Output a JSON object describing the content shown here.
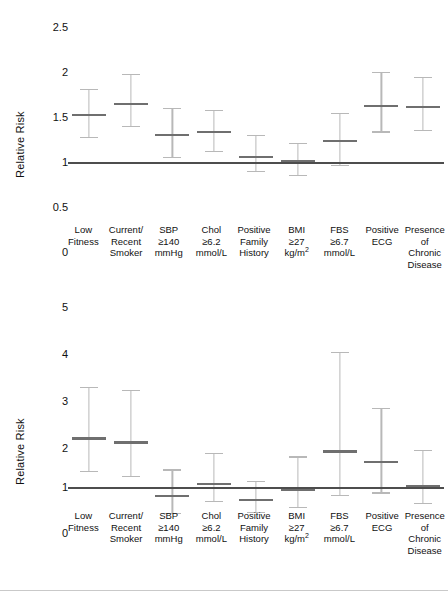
{
  "figure": {
    "background": "#ffffff",
    "line_color": "#b8b8b8",
    "marker_color": "#6f6f6f",
    "reference_line_color": "#4d4d4d"
  },
  "categories": [
    {
      "id": "low-fitness",
      "line1": "Low",
      "line2": "Fitness",
      "line3": "",
      "sup": ""
    },
    {
      "id": "current-smoker",
      "line1": "Current/",
      "line2": "Recent",
      "line3": "Smoker",
      "sup": ""
    },
    {
      "id": "sbp",
      "line1": "SBP",
      "line2": "≥140",
      "line3": "mmHg",
      "sup": ""
    },
    {
      "id": "chol",
      "line1": "Chol",
      "line2": "≥6.2",
      "line3": "mmol/L",
      "sup": ""
    },
    {
      "id": "family-history",
      "line1": "Positive",
      "line2": "Family",
      "line3": "History",
      "sup": ""
    },
    {
      "id": "bmi",
      "line1": "BMI",
      "line2": "≥27",
      "line3": "kg/m",
      "sup": "2"
    },
    {
      "id": "fbs",
      "line1": "FBS",
      "line2": "≥6.7",
      "line3": "mmol/L",
      "sup": ""
    },
    {
      "id": "positive-ecg",
      "line1": "Positive",
      "line2": "ECG",
      "line3": "",
      "sup": ""
    },
    {
      "id": "chronic-disease",
      "line1": "Presence",
      "line2": "of Chronic",
      "line3": "Disease",
      "sup": ""
    }
  ],
  "chart_data": [
    {
      "id": "chart-top",
      "type": "scatter",
      "title": "",
      "xlabel": "",
      "ylabel": "Relative Risk",
      "ylim": [
        0,
        2.5
      ],
      "yticks": [
        "0",
        "0.5",
        "1",
        "1.5",
        "2",
        "2.5"
      ],
      "ytick_values": [
        0,
        0.5,
        1,
        1.5,
        2,
        2.5
      ],
      "grid": false,
      "legend": "none",
      "reference_line": 1,
      "categories": [
        "Low Fitness",
        "Current/ Recent Smoker",
        "SBP ≥140 mmHg",
        "Chol ≥6.2 mmol/L",
        "Positive Family History",
        "BMI ≥27 kg/m2",
        "FBS ≥6.7 mmol/L",
        "Positive ECG",
        "Presence of Chronic Disease"
      ],
      "values": [
        1.52,
        1.65,
        1.3,
        1.33,
        1.06,
        1.01,
        1.23,
        1.62,
        1.61
      ],
      "lower": [
        1.28,
        1.4,
        1.06,
        1.12,
        0.9,
        0.86,
        0.97,
        1.34,
        1.36
      ],
      "upper": [
        1.81,
        1.98,
        1.6,
        1.58,
        1.3,
        1.21,
        1.55,
        2.0,
        1.95
      ]
    },
    {
      "id": "chart-bottom",
      "type": "scatter",
      "title": "",
      "xlabel": "",
      "ylabel": "Relative Risk",
      "ylim": [
        0,
        5
      ],
      "yticks": [
        "0",
        "1",
        "2",
        "3",
        "4",
        "5"
      ],
      "ytick_values": [
        0,
        1,
        2,
        3,
        4,
        5
      ],
      "grid": false,
      "legend": "none",
      "reference_line": 1,
      "categories": [
        "Low Fitness",
        "Current/ Recent Smoker",
        "SBP ≥140 mmHg",
        "Chol ≥6.2 mmol/L",
        "Positive Family History",
        "BMI ≥27 kg/m2",
        "FBS ≥6.7 mmol/L",
        "Positive ECG",
        "Presence of Chronic Disease"
      ],
      "values": [
        2.08,
        1.99,
        0.8,
        1.07,
        0.72,
        0.94,
        1.79,
        1.55,
        1.02
      ],
      "lower": [
        1.35,
        1.25,
        0.42,
        0.7,
        0.45,
        0.55,
        0.82,
        0.88,
        0.65
      ],
      "upper": [
        3.23,
        3.15,
        1.39,
        1.75,
        1.14,
        1.68,
        4.0,
        2.76,
        1.82
      ]
    }
  ]
}
